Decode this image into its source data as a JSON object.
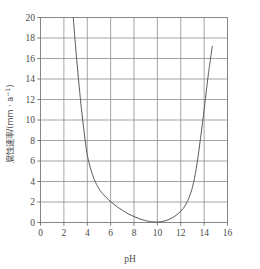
{
  "chart_data": {
    "type": "line",
    "title": "",
    "subtitle": "",
    "xlabel": "pH",
    "ylabel": "腐蚀速率/(mm · a⁻¹)",
    "ylabel_parts": {
      "name": "腐蚀速率",
      "slash": "/",
      "unit": "(mm · a⁻¹)"
    },
    "xlim": [
      0,
      16
    ],
    "ylim": [
      0,
      20
    ],
    "xticks": [
      0,
      2,
      4,
      6,
      8,
      10,
      12,
      14,
      16
    ],
    "yticks": [
      0,
      2,
      4,
      6,
      8,
      10,
      12,
      14,
      16,
      18,
      20
    ],
    "xtick_labels": [
      "0",
      "2",
      "4",
      "6",
      "8",
      "10",
      "12",
      "14",
      "16"
    ],
    "ytick_labels": [
      "0",
      "2",
      "4",
      "6",
      "8",
      "10",
      "12",
      "14",
      "16",
      "18",
      "20"
    ],
    "grid": true,
    "grid_color": "#8d8d8d",
    "legend": null,
    "legend_position": "none",
    "curve_color": "#5a5a5a",
    "background_color": "#ffffff",
    "series": [
      {
        "name": "corrosion rate vs pH",
        "x": [
          2.8,
          3.0,
          3.2,
          3.4,
          3.6,
          3.8,
          4.0,
          4.3,
          4.6,
          5.0,
          5.4,
          5.8,
          6.2,
          6.6,
          7.0,
          7.5,
          8.0,
          8.5,
          9.0,
          9.5,
          10.0,
          10.5,
          11.0,
          11.5,
          12.0,
          12.4,
          12.8,
          13.1,
          13.4,
          13.7,
          14.0,
          14.3,
          14.5,
          14.7
        ],
        "y": [
          20.0,
          17.2,
          14.6,
          12.2,
          10.1,
          8.2,
          6.6,
          5.2,
          4.2,
          3.3,
          2.7,
          2.25,
          1.85,
          1.5,
          1.2,
          0.85,
          0.58,
          0.35,
          0.18,
          0.07,
          0.05,
          0.12,
          0.3,
          0.62,
          1.1,
          1.7,
          2.7,
          3.9,
          5.8,
          8.3,
          11.0,
          13.9,
          15.6,
          17.2
        ]
      }
    ],
    "annotations": []
  },
  "figure": {
    "name": "corrosion-rate-vs-ph-chart",
    "width": 260,
    "height": 269
  }
}
